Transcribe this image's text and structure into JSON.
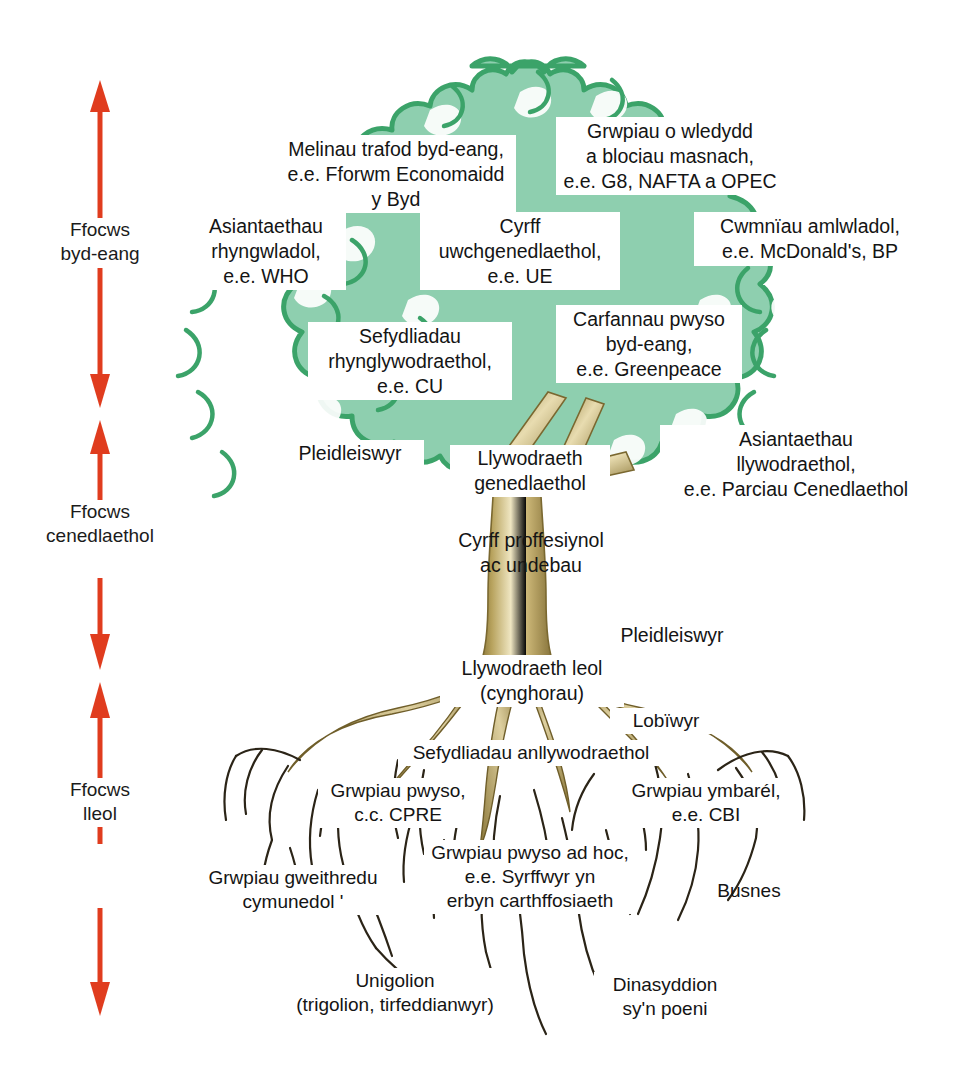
{
  "diagram": {
    "colors": {
      "canopy_fill": "#8ecfaf",
      "canopy_outline": "#3ba369",
      "trunk_light": "#efe3ba",
      "trunk_dark": "#8a7436",
      "root_line": "#2b2417",
      "arrow": "#e03c1e",
      "text": "#141414",
      "background": "#ffffff"
    }
  },
  "axis": {
    "name": "focus-scale",
    "segments": [
      {
        "id": "global",
        "label": "Ffocws\nbyd-eang"
      },
      {
        "id": "national",
        "label": "Ffocws\ncenedlaethol"
      },
      {
        "id": "local",
        "label": "Ffocws\nlleol"
      }
    ]
  },
  "canopy_labels": [
    {
      "id": "think-tanks",
      "text": "Melinau trafod byd-eang,\ne.e. Fforwm Economaidd\ny Byd"
    },
    {
      "id": "country-groups",
      "text": "Grwpiau o wledydd\na blociau masnach,\ne.e. G8, NAFTA a OPEC"
    },
    {
      "id": "international-agencies",
      "text": "Asiantaethau\nrhyngwladol,\ne.e. WHO"
    },
    {
      "id": "supranational-bodies",
      "text": "Cyrff\nuwchgenedlaethol,\ne.e. UE"
    },
    {
      "id": "multinationals",
      "text": "Cwmnïau amlwladol,\ne.e. McDonald's, BP"
    },
    {
      "id": "global-pressure",
      "text": "Carfannau pwyso\nbyd-eang,\ne.e. Greenpeace"
    },
    {
      "id": "intergovernmental",
      "text": "Sefydliadau\nrhynglywodraethol,\ne.e. CU"
    },
    {
      "id": "gov-agencies",
      "text": "Asiantaethau\nllywodraethol,\ne.e. Parciau Cenedlaethol"
    }
  ],
  "trunk_labels": [
    {
      "id": "voters-canopy",
      "text": "Pleidleiswyr"
    },
    {
      "id": "national-government",
      "text": "Llywodraeth\ngenedlaethol"
    },
    {
      "id": "professional-bodies",
      "text": "Cyrff proffesiynol\nac undebau"
    },
    {
      "id": "voters-trunk",
      "text": "Pleidleiswyr"
    },
    {
      "id": "local-government",
      "text": "Llywodraeth leol\n(cynghorau)"
    }
  ],
  "root_labels": [
    {
      "id": "lobbyists",
      "text": "Lobïwyr"
    },
    {
      "id": "ngos",
      "text": "Sefydliadau anllywodraethol"
    },
    {
      "id": "pressure-groups",
      "text": "Grwpiau pwyso,\nc.c. CPRE"
    },
    {
      "id": "umbrella-groups",
      "text": "Grwpiau ymbarél,\ne.e. CBI"
    },
    {
      "id": "community-action",
      "text": "Grwpiau gweithredu\ncymunedol '"
    },
    {
      "id": "adhoc-groups",
      "text": "Grwpiau pwyso ad hoc,\ne.e. Syrffwyr yn\nerbyn carthffosiaeth"
    },
    {
      "id": "business",
      "text": "Busnes"
    },
    {
      "id": "individuals",
      "text": "Unigolion\n(trigolion, tirfeddianwyr)"
    },
    {
      "id": "concerned-citizens",
      "text": "Dinasyddion\nsy'n poeni"
    }
  ]
}
